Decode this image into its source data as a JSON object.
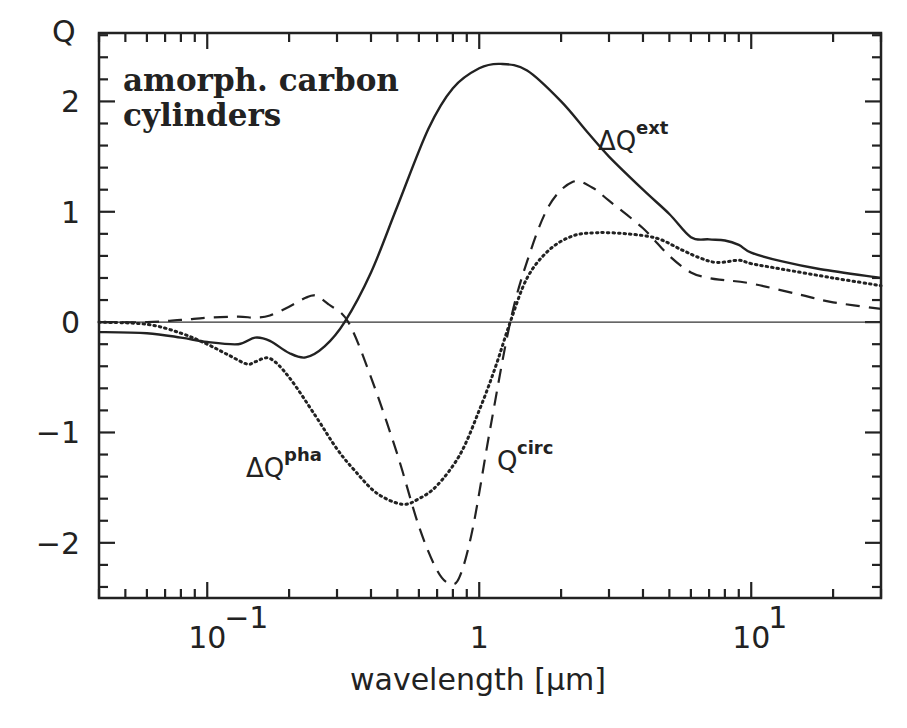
{
  "chart_data": {
    "type": "line",
    "title": "",
    "annotation": [
      "amorph. carbon",
      "cylinders"
    ],
    "xlabel": "wavelength [μm]",
    "ylabel": "Q",
    "xscale": "log",
    "xlim": [
      0.04,
      30
    ],
    "ylim": [
      -2.5,
      2.62
    ],
    "x_ticks": [
      {
        "value": 0.1,
        "base": "10",
        "exp": "−1"
      },
      {
        "value": 1,
        "base": "1",
        "exp": ""
      },
      {
        "value": 10,
        "base": "10",
        "exp": "1"
      }
    ],
    "y_ticks": [
      {
        "value": 2,
        "label": "2"
      },
      {
        "value": 1,
        "label": "1"
      },
      {
        "value": 0,
        "label": "0"
      },
      {
        "value": -1,
        "label": "−1"
      },
      {
        "value": -2,
        "label": "−2"
      }
    ],
    "y_minor_step": 0.2,
    "zero_line": true,
    "grid": false,
    "legend": "inline labels",
    "series": [
      {
        "name": "ΔQ^ext",
        "label_main": "ΔQ",
        "label_sup": "ext",
        "style": "solid",
        "label_pos": [
          598,
          150
        ],
        "x": [
          0.04,
          0.06,
          0.08,
          0.1,
          0.13,
          0.15,
          0.17,
          0.2,
          0.23,
          0.27,
          0.32,
          0.4,
          0.5,
          0.65,
          0.8,
          1.0,
          1.2,
          1.5,
          2.0,
          2.5,
          3.0,
          4.0,
          5.0,
          6.0,
          7.0,
          8.0,
          9.0,
          10,
          13,
          18,
          30
        ],
        "y": [
          -0.09,
          -0.1,
          -0.14,
          -0.18,
          -0.2,
          -0.14,
          -0.17,
          -0.28,
          -0.32,
          -0.22,
          0.0,
          0.45,
          1.05,
          1.75,
          2.12,
          2.3,
          2.34,
          2.28,
          2.0,
          1.72,
          1.5,
          1.2,
          0.98,
          0.77,
          0.75,
          0.74,
          0.7,
          0.63,
          0.55,
          0.48,
          0.4
        ]
      },
      {
        "name": "Q^circ",
        "label_main": "Q",
        "label_sup": "circ",
        "style": "dashed",
        "label_pos": [
          497,
          470
        ],
        "x": [
          0.04,
          0.06,
          0.08,
          0.1,
          0.13,
          0.15,
          0.17,
          0.2,
          0.23,
          0.25,
          0.28,
          0.33,
          0.4,
          0.5,
          0.6,
          0.7,
          0.78,
          0.85,
          0.95,
          1.1,
          1.3,
          1.5,
          1.8,
          2.2,
          2.6,
          3.0,
          4.0,
          5.0,
          6.0,
          7.0,
          8.0,
          10,
          15,
          20,
          30
        ],
        "y": [
          0.0,
          0.0,
          0.02,
          0.04,
          0.05,
          0.04,
          0.06,
          0.14,
          0.22,
          0.24,
          0.16,
          0.0,
          -0.5,
          -1.2,
          -1.85,
          -2.25,
          -2.37,
          -2.3,
          -1.85,
          -0.95,
          0.0,
          0.55,
          1.05,
          1.27,
          1.22,
          1.1,
          0.85,
          0.6,
          0.45,
          0.4,
          0.38,
          0.35,
          0.25,
          0.18,
          0.12
        ]
      },
      {
        "name": "ΔQ^pha",
        "label_main": "ΔQ",
        "label_sup": "pha",
        "style": "dotted",
        "label_pos": [
          246,
          477
        ],
        "x": [
          0.04,
          0.06,
          0.08,
          0.1,
          0.12,
          0.14,
          0.15,
          0.17,
          0.2,
          0.25,
          0.3,
          0.35,
          0.42,
          0.52,
          0.6,
          0.7,
          0.85,
          1.0,
          1.15,
          1.3,
          1.5,
          1.8,
          2.2,
          2.7,
          3.5,
          4.5,
          5.5,
          6.5,
          7.5,
          9.0,
          10,
          13,
          20,
          30
        ],
        "y": [
          0.0,
          -0.02,
          -0.1,
          -0.2,
          -0.3,
          -0.38,
          -0.36,
          -0.33,
          -0.5,
          -0.85,
          -1.15,
          -1.35,
          -1.55,
          -1.65,
          -1.6,
          -1.48,
          -1.2,
          -0.8,
          -0.4,
          0.0,
          0.4,
          0.65,
          0.78,
          0.81,
          0.8,
          0.76,
          0.66,
          0.58,
          0.54,
          0.56,
          0.53,
          0.48,
          0.4,
          0.33
        ]
      }
    ]
  },
  "labels": {
    "y_axis_title": "Q",
    "x_axis_title": "wavelength [μm]",
    "annotation_line1": "amorph. carbon",
    "annotation_line2": "cylinders"
  }
}
